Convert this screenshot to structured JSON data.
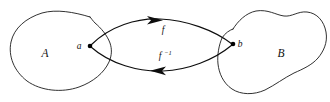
{
  "figure": {
    "background_color": "#ffffff",
    "stroke_color": "#111111",
    "width": 330,
    "height": 102
  },
  "sets": {
    "left": {
      "label": "A",
      "label_x": 45,
      "label_y": 57
    },
    "right": {
      "label": "B",
      "label_x": 281,
      "label_y": 57
    }
  },
  "points": {
    "domain_element": {
      "label": "a",
      "label_x": 79,
      "label_y": 49,
      "dot_x": 90,
      "dot_y": 46
    },
    "codomain_element": {
      "label": "b",
      "label_x": 240,
      "label_y": 47,
      "dot_x": 233,
      "dot_y": 44
    }
  },
  "maps": {
    "forward": {
      "label": "f",
      "superscript": "",
      "label_x": 163,
      "label_y": 33,
      "direction": "right"
    },
    "inverse": {
      "label": "f",
      "superscript": "−1",
      "label_x": 160,
      "label_y": 59,
      "direction": "left"
    }
  }
}
